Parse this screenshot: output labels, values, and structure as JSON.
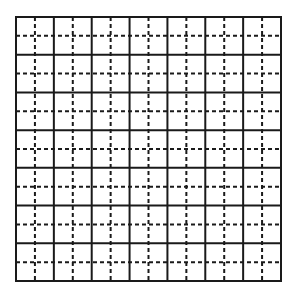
{
  "diagram": {
    "type": "grid",
    "major_divisions": 7,
    "minor_per_major": 2,
    "bounds": {
      "x": 16,
      "y": 17,
      "width": 265,
      "height": 264
    },
    "colors": {
      "background": "#ffffff",
      "line": "#1a1a1a"
    },
    "solid_line_width": 2,
    "dashed_line_width": 2,
    "dash_pattern": "4,3"
  }
}
